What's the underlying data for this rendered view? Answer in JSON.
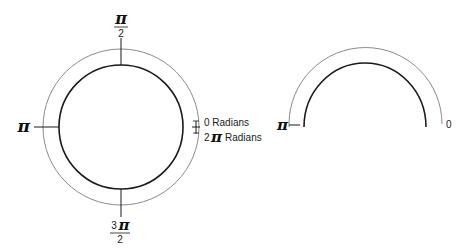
{
  "diagram": {
    "full_circle": {
      "labels": {
        "top_num": "π",
        "top_den": "2",
        "left": "π",
        "bottom_num_3": "3",
        "bottom_num_pi": "π",
        "bottom_den": "2",
        "right_zero": "0 Radians",
        "right_two": "2",
        "right_two_pi": "π",
        "right_two_suffix": "Radians"
      }
    },
    "semicircle": {
      "labels": {
        "left": "π",
        "right": "0"
      }
    },
    "colors": {
      "inner_stroke": "#1a1a1a",
      "outer_stroke": "#8a8a8a"
    }
  }
}
